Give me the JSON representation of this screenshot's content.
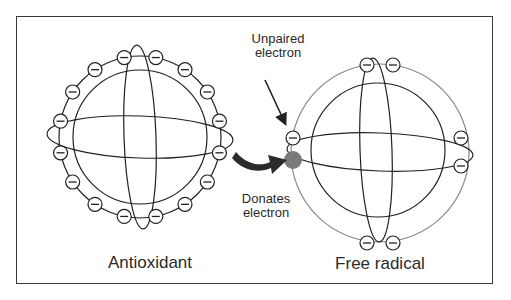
{
  "diagram": {
    "labels": {
      "antioxidant": "Antioxidant",
      "free_radical": "Free radical",
      "unpaired_line1": "Unpaired",
      "unpaired_line2": "electron",
      "donates_line1": "Donates",
      "donates_line2": "electron"
    },
    "electron_symbol": "minus",
    "colors": {
      "line": "#222222",
      "free_radical_ring": "#8a8a8a",
      "donated_electron": "#7a7a7a",
      "arrow": "#2b2b2b",
      "frame": "#3a3a3a"
    },
    "antioxidant": {
      "center": [
        140,
        137
      ],
      "ring_radius": 81,
      "electron_count": 16
    },
    "free_radical": {
      "center": [
        380,
        153
      ],
      "ring_radius": 89,
      "electrons": [
        [
          367,
          65
        ],
        [
          393,
          65
        ],
        [
          293,
          138
        ],
        [
          461,
          138
        ],
        [
          461,
          166
        ],
        [
          367,
          243
        ],
        [
          393,
          243
        ]
      ],
      "donated_electron": [
        293,
        160
      ]
    }
  }
}
